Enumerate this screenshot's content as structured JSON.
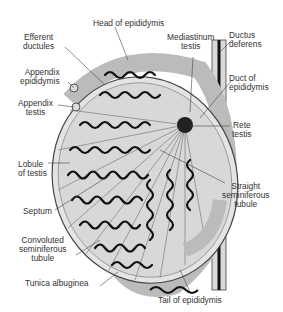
{
  "figure": {
    "labels": {
      "head_of_epididymis": "Head of epididymis",
      "efferent_ductules": [
        "Efferent",
        "ductules"
      ],
      "appendix_epididymis": [
        "Appendix",
        "epididymis"
      ],
      "appendix_testis": [
        "Appendix",
        "testis"
      ],
      "lobule_of_testis": [
        "Lobule",
        "of testis"
      ],
      "septum": "Septum",
      "convoluted_seminiferous_tubule": [
        "Convoluted",
        "seminiferous",
        "tubule"
      ],
      "tunica_albuginea": "Tunica albuginea",
      "mediastinum_testis": [
        "Mediastinum",
        "testis"
      ],
      "ductus_deferens": [
        "Ductus",
        "deferens"
      ],
      "duct_of_epididymis": [
        "Duct of",
        "epididymis"
      ],
      "rete_testis": [
        "Rete",
        "testis"
      ],
      "straight_seminiferous_tubule": [
        "Straight",
        "seminiferous",
        "tubule"
      ],
      "tail_of_epididymis": "Tail of epididymis"
    }
  }
}
